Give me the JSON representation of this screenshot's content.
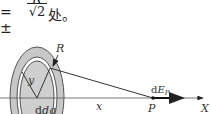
{
  "formula": {
    "prefix": "= ±",
    "numerator": "R",
    "denominator": "√2",
    "suffix": "处。"
  },
  "figure": {
    "labels": {
      "radius": "R",
      "ring_radius": "y",
      "charge": "dq",
      "distance": "x",
      "point": "P",
      "field": "dE",
      "field_subscript": "P",
      "axis": "X"
    },
    "colors": {
      "ring_fill": "#c8c8c8",
      "line": "#333333"
    }
  }
}
